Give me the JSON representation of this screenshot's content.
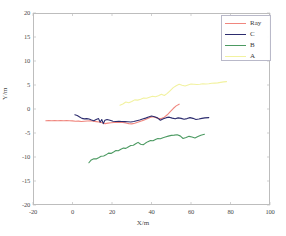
{
  "chart_data": {
    "type": "line",
    "title": "",
    "xlabel": "X/m",
    "ylabel": "Y/m",
    "xlim": [
      -20,
      100
    ],
    "ylim": [
      -20,
      20
    ],
    "xticks": [
      -20,
      0,
      20,
      40,
      60,
      80,
      100
    ],
    "yticks": [
      20,
      15,
      10,
      5,
      0,
      -5,
      -10,
      -15,
      -20
    ],
    "grid": false,
    "legend_position": "top-right",
    "series": [
      {
        "name": "Ray",
        "color": "#f0867e",
        "points": [
          [
            -13.5,
            -2.45
          ],
          [
            -12.0,
            -2.4
          ],
          [
            -10.5,
            -2.45
          ],
          [
            -9.0,
            -2.4
          ],
          [
            -7.5,
            -2.45
          ],
          [
            -6.0,
            -2.4
          ],
          [
            -4.5,
            -2.45
          ],
          [
            -3.0,
            -2.42
          ],
          [
            -1.5,
            -2.45
          ],
          [
            0.0,
            -2.48
          ],
          [
            1.5,
            -2.55
          ],
          [
            3.0,
            -2.52
          ],
          [
            4.5,
            -2.6
          ],
          [
            6.0,
            -2.55
          ],
          [
            7.5,
            -2.5
          ],
          [
            9.0,
            -2.45
          ],
          [
            10.5,
            -2.55
          ],
          [
            12.0,
            -2.62
          ],
          [
            13.5,
            -2.7
          ],
          [
            15.0,
            -2.85
          ],
          [
            16.5,
            -3.05
          ],
          [
            18.0,
            -2.95
          ],
          [
            19.5,
            -2.88
          ],
          [
            21.0,
            -2.82
          ],
          [
            22.5,
            -2.8
          ],
          [
            24.0,
            -2.78
          ],
          [
            25.5,
            -2.82
          ],
          [
            27.0,
            -2.9
          ],
          [
            28.5,
            -3.05
          ],
          [
            30.0,
            -3.1
          ],
          [
            31.5,
            -2.95
          ],
          [
            33.0,
            -2.75
          ],
          [
            34.5,
            -2.55
          ],
          [
            36.0,
            -2.35
          ],
          [
            37.5,
            -2.1
          ],
          [
            39.0,
            -1.8
          ],
          [
            40.5,
            -1.6
          ],
          [
            42.0,
            -1.75
          ],
          [
            43.5,
            -1.95
          ],
          [
            45.0,
            -2.0
          ],
          [
            46.5,
            -1.7
          ],
          [
            48.0,
            -1.2
          ],
          [
            49.5,
            -0.55
          ],
          [
            51.0,
            0.1
          ],
          [
            52.5,
            0.65
          ],
          [
            54.0,
            1.0
          ]
        ]
      },
      {
        "name": "C",
        "color": "#2c2c6e",
        "points": [
          [
            1.2,
            -1.2
          ],
          [
            2.4,
            -1.35
          ],
          [
            3.6,
            -1.65
          ],
          [
            4.8,
            -1.95
          ],
          [
            6.0,
            -2.05
          ],
          [
            7.2,
            -2.0
          ],
          [
            8.4,
            -2.1
          ],
          [
            9.6,
            -2.3
          ],
          [
            10.8,
            -2.45
          ],
          [
            12.0,
            -2.2
          ],
          [
            13.2,
            -2.0
          ],
          [
            14.0,
            -2.75
          ],
          [
            14.8,
            -2.2
          ],
          [
            15.6,
            -3.05
          ],
          [
            16.4,
            -2.35
          ],
          [
            17.5,
            -2.2
          ],
          [
            19.0,
            -2.35
          ],
          [
            20.5,
            -2.55
          ],
          [
            22.0,
            -2.6
          ],
          [
            23.5,
            -2.55
          ],
          [
            25.0,
            -2.6
          ],
          [
            26.5,
            -2.62
          ],
          [
            28.0,
            -2.65
          ],
          [
            29.5,
            -2.7
          ],
          [
            31.0,
            -2.6
          ],
          [
            32.5,
            -2.45
          ],
          [
            34.0,
            -2.3
          ],
          [
            35.5,
            -2.1
          ],
          [
            37.0,
            -1.9
          ],
          [
            38.5,
            -1.65
          ],
          [
            40.0,
            -1.45
          ],
          [
            41.5,
            -1.6
          ],
          [
            43.0,
            -1.85
          ],
          [
            44.5,
            -2.35
          ],
          [
            46.0,
            -2.05
          ],
          [
            47.5,
            -1.8
          ],
          [
            49.0,
            -1.7
          ],
          [
            50.5,
            -1.9
          ],
          [
            52.0,
            -2.05
          ],
          [
            53.5,
            -1.85
          ],
          [
            55.0,
            -1.95
          ],
          [
            56.5,
            -2.15
          ],
          [
            58.0,
            -2.0
          ],
          [
            59.5,
            -1.8
          ],
          [
            61.0,
            -1.95
          ],
          [
            62.5,
            -2.2
          ],
          [
            64.0,
            -2.1
          ],
          [
            65.5,
            -1.95
          ],
          [
            67.0,
            -1.85
          ],
          [
            69.0,
            -1.8
          ]
        ]
      },
      {
        "name": "B",
        "color": "#4c9a62",
        "points": [
          [
            8.3,
            -11.2
          ],
          [
            9.5,
            -10.6
          ],
          [
            10.8,
            -10.35
          ],
          [
            12.0,
            -10.4
          ],
          [
            13.2,
            -10.15
          ],
          [
            14.5,
            -9.85
          ],
          [
            15.8,
            -9.8
          ],
          [
            17.0,
            -9.55
          ],
          [
            18.2,
            -9.2
          ],
          [
            19.5,
            -9.25
          ],
          [
            20.8,
            -8.95
          ],
          [
            22.0,
            -8.65
          ],
          [
            23.2,
            -8.7
          ],
          [
            24.5,
            -8.4
          ],
          [
            25.8,
            -8.15
          ],
          [
            27.0,
            -8.2
          ],
          [
            28.2,
            -7.9
          ],
          [
            29.5,
            -7.6
          ],
          [
            30.8,
            -7.55
          ],
          [
            32.0,
            -7.25
          ],
          [
            33.2,
            -6.95
          ],
          [
            34.5,
            -7.35
          ],
          [
            35.8,
            -7.45
          ],
          [
            37.0,
            -7.1
          ],
          [
            38.2,
            -6.8
          ],
          [
            39.5,
            -6.55
          ],
          [
            40.8,
            -6.6
          ],
          [
            42.0,
            -6.35
          ],
          [
            43.2,
            -6.15
          ],
          [
            44.5,
            -6.2
          ],
          [
            45.8,
            -6.0
          ],
          [
            47.0,
            -5.85
          ],
          [
            48.5,
            -5.65
          ],
          [
            50.0,
            -5.5
          ],
          [
            51.5,
            -5.45
          ],
          [
            53.0,
            -5.35
          ],
          [
            54.5,
            -5.6
          ],
          [
            56.0,
            -6.15
          ],
          [
            57.5,
            -5.95
          ],
          [
            59.0,
            -5.7
          ],
          [
            60.5,
            -5.85
          ],
          [
            62.0,
            -6.05
          ],
          [
            63.5,
            -5.75
          ],
          [
            65.0,
            -5.45
          ],
          [
            66.8,
            -5.25
          ]
        ]
      },
      {
        "name": "A",
        "color": "#f2f2a0",
        "points": [
          [
            24.0,
            0.8
          ],
          [
            25.5,
            1.05
          ],
          [
            27.0,
            1.45
          ],
          [
            28.5,
            1.3
          ],
          [
            30.0,
            1.55
          ],
          [
            31.5,
            1.9
          ],
          [
            33.0,
            1.85
          ],
          [
            34.5,
            2.05
          ],
          [
            36.0,
            2.3
          ],
          [
            37.5,
            2.25
          ],
          [
            39.0,
            2.45
          ],
          [
            40.5,
            2.65
          ],
          [
            42.0,
            2.55
          ],
          [
            43.5,
            2.75
          ],
          [
            45.0,
            3.05
          ],
          [
            46.5,
            2.8
          ],
          [
            48.0,
            3.25
          ],
          [
            49.5,
            3.85
          ],
          [
            51.0,
            4.45
          ],
          [
            52.5,
            4.85
          ],
          [
            54.0,
            5.15
          ],
          [
            55.5,
            4.95
          ],
          [
            57.0,
            4.8
          ],
          [
            58.5,
            5.0
          ],
          [
            60.0,
            5.2
          ],
          [
            61.5,
            5.15
          ],
          [
            63.0,
            5.1
          ],
          [
            64.5,
            5.15
          ],
          [
            66.0,
            5.25
          ],
          [
            67.5,
            5.2
          ],
          [
            69.0,
            5.25
          ],
          [
            70.5,
            5.35
          ],
          [
            72.0,
            5.4
          ],
          [
            73.5,
            5.45
          ],
          [
            75.0,
            5.55
          ],
          [
            76.5,
            5.65
          ],
          [
            78.0,
            5.7
          ]
        ]
      }
    ]
  },
  "axes": {
    "x_title": "X/m",
    "y_title": "Y/m",
    "x_tick_labels": [
      "-20",
      "0",
      "20",
      "40",
      "60",
      "80",
      "100"
    ],
    "y_tick_labels": [
      "20",
      "15",
      "10",
      "5",
      "0",
      "-5",
      "-10",
      "-15",
      "-20"
    ]
  },
  "legend": {
    "entries": [
      {
        "label": "Ray",
        "color": "#f0867e"
      },
      {
        "label": "C",
        "color": "#2c2c6e"
      },
      {
        "label": "B",
        "color": "#4c9a62"
      },
      {
        "label": "A",
        "color": "#f2f2a0"
      }
    ]
  }
}
